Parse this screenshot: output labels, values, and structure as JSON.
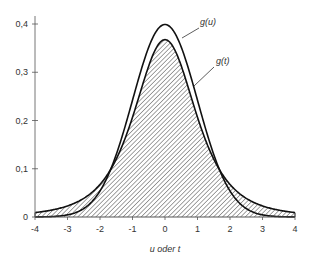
{
  "chart_data": {
    "type": "line",
    "title": "",
    "xlabel": "u oder t",
    "ylabel": "",
    "xlim": [
      -4,
      4
    ],
    "ylim": [
      0,
      0.4
    ],
    "grid": false,
    "x_ticks": [
      "-4",
      "-3",
      "-2",
      "-1",
      "0",
      "1",
      "2",
      "3",
      "4"
    ],
    "y_ticks": [
      "0",
      "0,1",
      "0,2",
      "0,3",
      "0,4"
    ],
    "series": [
      {
        "name": "g(u)",
        "distribution": "standard normal",
        "peak": 0.399,
        "filled": false,
        "x": [
          -4,
          -3,
          -2,
          -1,
          0,
          1,
          2,
          3,
          4
        ],
        "values": [
          0.0001,
          0.0044,
          0.054,
          0.242,
          0.399,
          0.242,
          0.054,
          0.0044,
          0.0001
        ]
      },
      {
        "name": "g(t)",
        "distribution": "Student t (df=3)",
        "peak": 0.368,
        "filled": true,
        "fill": "hatched",
        "x": [
          -4,
          -3,
          -2,
          -1,
          0,
          1,
          2,
          3,
          4
        ],
        "values": [
          0.009,
          0.023,
          0.068,
          0.207,
          0.368,
          0.207,
          0.068,
          0.023,
          0.009
        ]
      }
    ],
    "annotations": [
      {
        "text": "g(u)",
        "target": "normal curve"
      },
      {
        "text": "g(t)",
        "target": "t curve"
      }
    ]
  },
  "labels": {
    "xlabel": "u oder t",
    "gu": "g(u)",
    "gt": "g(t)",
    "x_ticks": [
      "-4",
      "-3",
      "-2",
      "-1",
      "0",
      "1",
      "2",
      "3",
      "4"
    ],
    "y_ticks": [
      "0",
      "0,1",
      "0,2",
      "0,3",
      "0,4"
    ]
  }
}
